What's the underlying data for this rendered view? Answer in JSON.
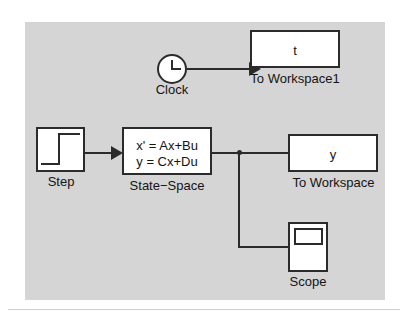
{
  "diagram": {
    "canvas_color": "#d5d5d5",
    "line_color": "#2b2b2b",
    "block_fill": "#ffffff",
    "page_background": "#ffffff"
  },
  "blocks": {
    "clock": {
      "label": "Clock",
      "icon": "clock-icon",
      "shape": "circle"
    },
    "to_workspace1": {
      "label": "To Workspace1",
      "variable": "t",
      "shape": "rectangle"
    },
    "step": {
      "label": "Step",
      "icon": "step-waveform-icon",
      "shape": "rectangle"
    },
    "state_space": {
      "label": "State−Space",
      "equation_line1": "x' = Ax+Bu",
      "equation_line2": "y = Cx+Du",
      "shape": "rectangle"
    },
    "to_workspace": {
      "label": "To Workspace",
      "variable": "y",
      "shape": "rectangle"
    },
    "scope": {
      "label": "Scope",
      "icon": "scope-screen-icon",
      "shape": "rectangle"
    }
  },
  "connections": [
    {
      "name": "clock-to-workspace1",
      "from": "clock",
      "to": "to_workspace1"
    },
    {
      "name": "step-to-state-space",
      "from": "step",
      "to": "state_space"
    },
    {
      "name": "state-space-to-to-workspace",
      "from": "state_space",
      "to": "to_workspace"
    },
    {
      "name": "branch-to-scope",
      "from": "state_space",
      "to": "scope"
    }
  ]
}
